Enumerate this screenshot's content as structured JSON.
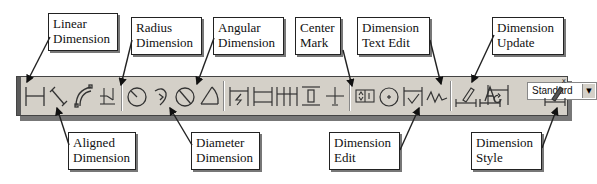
{
  "toolbar": {
    "name": "Dimension",
    "style_combo": {
      "value": "Standard"
    },
    "close_label": "x",
    "buttons": [
      {
        "id": "linear",
        "icon": "linear-dimension-icon"
      },
      {
        "id": "aligned",
        "icon": "aligned-dimension-icon"
      },
      {
        "id": "arc-length",
        "icon": "arc-length-icon"
      },
      {
        "id": "ordinate",
        "icon": "ordinate-dimension-icon"
      },
      {
        "id": "radius",
        "icon": "radius-dimension-icon"
      },
      {
        "id": "jogged",
        "icon": "jogged-dimension-icon"
      },
      {
        "id": "diameter",
        "icon": "diameter-dimension-icon"
      },
      {
        "id": "angular",
        "icon": "angular-dimension-icon"
      },
      {
        "id": "quick",
        "icon": "quick-dimension-icon"
      },
      {
        "id": "baseline",
        "icon": "baseline-dimension-icon"
      },
      {
        "id": "continue",
        "icon": "continue-dimension-icon"
      },
      {
        "id": "space",
        "icon": "dimension-space-icon"
      },
      {
        "id": "break",
        "icon": "dimension-break-icon"
      },
      {
        "id": "tolerance",
        "icon": "tolerance-icon"
      },
      {
        "id": "center-mark",
        "icon": "center-mark-icon"
      },
      {
        "id": "inspection",
        "icon": "inspection-icon"
      },
      {
        "id": "jogged-linear",
        "icon": "jogged-linear-icon"
      },
      {
        "id": "dimension-edit",
        "icon": "dimension-edit-icon"
      },
      {
        "id": "dimension-text-edit",
        "icon": "dimension-text-edit-icon"
      },
      {
        "id": "dimension-update",
        "icon": "dimension-update-icon"
      },
      {
        "id": "dimension-style",
        "icon": "dimension-style-icon"
      }
    ]
  },
  "callouts": {
    "linear": [
      "Linear",
      "Dimension"
    ],
    "radius": [
      "Radius",
      "Dimension"
    ],
    "angular": [
      "Angular",
      "Dimension"
    ],
    "center_mark": [
      "Center",
      "Mark"
    ],
    "text_edit": [
      "Dimension",
      "Text Edit"
    ],
    "update": [
      "Dimension",
      "Update"
    ],
    "aligned": [
      "Aligned",
      "Dimension"
    ],
    "diameter": [
      "Diameter",
      "Dimension"
    ],
    "edit": [
      "Dimension",
      "Edit"
    ],
    "style": [
      "Dimension",
      "Style"
    ]
  }
}
